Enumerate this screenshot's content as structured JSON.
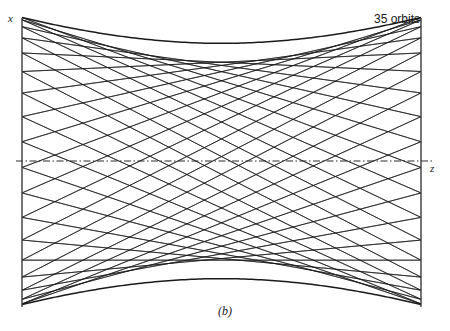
{
  "figure": {
    "caption": "(b)",
    "annotation": "35 orbits",
    "axis_x_label": "x",
    "axis_z_label": "z",
    "background_color": "#ffffff",
    "ray_color": "#1a1a1a",
    "mirror_color": "#3a3a3a",
    "axis_color": "#2a2a2a"
  },
  "chart_data": {
    "type": "line",
    "title": "",
    "subtitle": "",
    "xlabel": "z",
    "ylabel": "x",
    "annotations": [
      "35 orbits",
      "(b)"
    ],
    "legend": [],
    "grid": false,
    "axis_ranges": {
      "z_pixels": [
        22,
        421
      ],
      "x_pixels": [
        18,
        305
      ],
      "z_normalized": [
        -1,
        1
      ],
      "x_normalized": [
        -1,
        1
      ]
    },
    "optical_axis": {
      "style": "dash-dot",
      "x_pixel": 161,
      "x_value": 0
    },
    "mirrors": [
      {
        "name": "left-mirror",
        "z_pixel": 22,
        "x_top_pixel": 18,
        "x_bottom_pixel": 307
      },
      {
        "name": "right-mirror",
        "z_pixel": 421,
        "x_top_pixel": 18,
        "x_bottom_pixel": 307
      }
    ],
    "orbits": 35,
    "bounces": 70,
    "envelope": {
      "type": "hyperbolic",
      "amplitude_at_mirrors": 1.0,
      "waist_amplitude": 0.82,
      "waist_position": 0.0
    },
    "ray_pattern": {
      "rotation_per_bounce_deg": 92.571,
      "families": 2,
      "description": "Each bounce advances the phase of the transverse oscillation, producing two interleaved families of straight segments that cross in a diamond lattice."
    },
    "series": [
      {
        "name": "beam-envelope-upper",
        "x": [
          -1.0,
          -0.8,
          -0.6,
          -0.4,
          -0.2,
          0.0,
          0.2,
          0.4,
          0.6,
          0.8,
          1.0
        ],
        "values": [
          1.0,
          0.944,
          0.9,
          0.862,
          0.835,
          0.82,
          0.835,
          0.862,
          0.9,
          0.944,
          1.0
        ]
      },
      {
        "name": "beam-envelope-lower",
        "x": [
          -1.0,
          -0.8,
          -0.6,
          -0.4,
          -0.2,
          0.0,
          0.2,
          0.4,
          0.6,
          0.8,
          1.0
        ],
        "values": [
          -1.0,
          -0.944,
          -0.9,
          -0.862,
          -0.835,
          -0.82,
          -0.835,
          -0.862,
          -0.9,
          -0.944,
          -1.0
        ]
      },
      {
        "name": "optical-axis",
        "x": [
          -1.0,
          1.0
        ],
        "values": [
          0.0,
          0.0
        ]
      }
    ]
  }
}
